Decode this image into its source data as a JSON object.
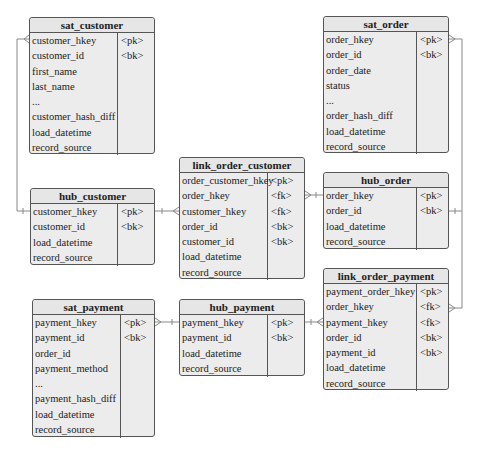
{
  "entities": {
    "sat_customer": {
      "title": "sat_customer",
      "rows": [
        {
          "name": "customer_hkey",
          "key": "<pk>"
        },
        {
          "name": "customer_id",
          "key": "<bk>"
        },
        {
          "name": "first_name",
          "key": ""
        },
        {
          "name": "last_name",
          "key": ""
        },
        {
          "name": "...",
          "key": ""
        },
        {
          "name": "customer_hash_diff",
          "key": ""
        },
        {
          "name": "load_datetime",
          "key": ""
        },
        {
          "name": "record_source",
          "key": ""
        }
      ]
    },
    "hub_customer": {
      "title": "hub_customer",
      "rows": [
        {
          "name": "customer_hkey",
          "key": "<pk>"
        },
        {
          "name": "customer_id",
          "key": "<bk>"
        },
        {
          "name": "load_datetime",
          "key": ""
        },
        {
          "name": "record_source",
          "key": ""
        }
      ]
    },
    "link_order_customer": {
      "title": "link_order_customer",
      "rows": [
        {
          "name": "order_customer_hkey",
          "key": "<pk>"
        },
        {
          "name": "order_hkey",
          "key": "<fk>"
        },
        {
          "name": "customer_hkey",
          "key": "<fk>"
        },
        {
          "name": "order_id",
          "key": "<bk>"
        },
        {
          "name": "customer_id",
          "key": "<bk>"
        },
        {
          "name": "load_datetime",
          "key": ""
        },
        {
          "name": "record_source",
          "key": ""
        }
      ]
    },
    "sat_order": {
      "title": "sat_order",
      "rows": [
        {
          "name": "order_hkey",
          "key": "<pk>"
        },
        {
          "name": "order_id",
          "key": "<bk>"
        },
        {
          "name": "order_date",
          "key": ""
        },
        {
          "name": "status",
          "key": ""
        },
        {
          "name": "...",
          "key": ""
        },
        {
          "name": "order_hash_diff",
          "key": ""
        },
        {
          "name": "load_datetime",
          "key": ""
        },
        {
          "name": "record_source",
          "key": ""
        }
      ]
    },
    "hub_order": {
      "title": "hub_order",
      "rows": [
        {
          "name": "order_hkey",
          "key": "<pk>"
        },
        {
          "name": "order_id",
          "key": "<bk>"
        },
        {
          "name": "load_datetime",
          "key": ""
        },
        {
          "name": "record_source",
          "key": ""
        }
      ]
    },
    "link_order_payment": {
      "title": "link_order_payment",
      "rows": [
        {
          "name": "payment_order_hkey",
          "key": "<pk>"
        },
        {
          "name": "order_hkey",
          "key": "<fk>"
        },
        {
          "name": "payment_hkey",
          "key": "<fk>"
        },
        {
          "name": "order_id",
          "key": "<bk>"
        },
        {
          "name": "payment_id",
          "key": "<bk>"
        },
        {
          "name": "load_datetime",
          "key": ""
        },
        {
          "name": "record_source",
          "key": ""
        }
      ]
    },
    "sat_payment": {
      "title": "sat_payment",
      "rows": [
        {
          "name": "payment_hkey",
          "key": "<pk>"
        },
        {
          "name": "payment_id",
          "key": "<bk>"
        },
        {
          "name": "order_id",
          "key": ""
        },
        {
          "name": "payment_method",
          "key": ""
        },
        {
          "name": "...",
          "key": ""
        },
        {
          "name": "payment_hash_diff",
          "key": ""
        },
        {
          "name": "load_datetime",
          "key": ""
        },
        {
          "name": "record_source",
          "key": ""
        }
      ]
    },
    "hub_payment": {
      "title": "hub_payment",
      "rows": [
        {
          "name": "payment_hkey",
          "key": "<pk>"
        },
        {
          "name": "payment_id",
          "key": "<bk>"
        },
        {
          "name": "load_datetime",
          "key": ""
        },
        {
          "name": "record_source",
          "key": ""
        }
      ]
    }
  },
  "relationships": [
    {
      "from": "hub_customer",
      "to": "sat_customer",
      "type": "one-to-many"
    },
    {
      "from": "hub_customer",
      "to": "link_order_customer",
      "type": "one-to-many"
    },
    {
      "from": "hub_order",
      "to": "link_order_customer",
      "type": "one-to-many"
    },
    {
      "from": "hub_order",
      "to": "sat_order",
      "type": "one-to-many"
    },
    {
      "from": "hub_order",
      "to": "link_order_payment",
      "type": "one-to-many"
    },
    {
      "from": "hub_payment",
      "to": "sat_payment",
      "type": "one-to-many"
    },
    {
      "from": "hub_payment",
      "to": "link_order_payment",
      "type": "one-to-many"
    }
  ],
  "colors": {
    "box_fill": "#ececec",
    "border": "#555555",
    "line": "#888888"
  }
}
